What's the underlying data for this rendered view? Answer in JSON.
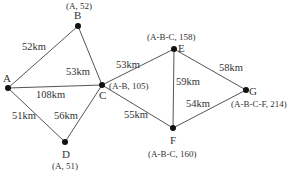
{
  "diagram": {
    "type": "weighted-graph-shortest-path",
    "colors": {
      "edge": "#555555",
      "node": "#111111",
      "text": "#333333"
    },
    "nodes": [
      {
        "id": "A",
        "label": "A",
        "annotation": ""
      },
      {
        "id": "B",
        "label": "B",
        "annotation": "(A, 52)"
      },
      {
        "id": "C",
        "label": "C",
        "annotation": "(A-B, 105)"
      },
      {
        "id": "D",
        "label": "D",
        "annotation": "(A, 51)"
      },
      {
        "id": "E",
        "label": "E",
        "annotation": "(A-B-C, 158)"
      },
      {
        "id": "F",
        "label": "F",
        "annotation": "(A-B-C, 160)"
      },
      {
        "id": "G",
        "label": "G",
        "annotation": "(A-B-C-F, 214)"
      }
    ],
    "edges": [
      {
        "from": "A",
        "to": "B",
        "weight": "52km"
      },
      {
        "from": "B",
        "to": "C",
        "weight": "53km"
      },
      {
        "from": "A",
        "to": "C",
        "weight": "108km"
      },
      {
        "from": "A",
        "to": "D",
        "weight": "51km"
      },
      {
        "from": "D",
        "to": "C",
        "weight": "56km"
      },
      {
        "from": "C",
        "to": "E",
        "weight": "53km"
      },
      {
        "from": "C",
        "to": "F",
        "weight": "55km"
      },
      {
        "from": "E",
        "to": "F",
        "weight": "59km"
      },
      {
        "from": "E",
        "to": "G",
        "weight": "58km"
      },
      {
        "from": "F",
        "to": "G",
        "weight": "54km"
      }
    ]
  }
}
